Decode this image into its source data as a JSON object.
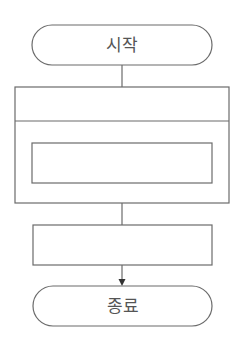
{
  "diagram": {
    "type": "flowchart",
    "start": {
      "label": "시작"
    },
    "loop_block": {
      "header_label": "",
      "inner_process_label": ""
    },
    "process": {
      "label": ""
    },
    "end": {
      "label": "종료"
    },
    "colors": {
      "stroke": "#6b6b6b",
      "text": "#555555",
      "background": "#ffffff"
    }
  }
}
